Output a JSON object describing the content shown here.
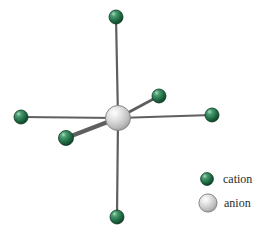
{
  "figure": {
    "title": "",
    "type": "octahedral-coordination-diagram",
    "background_color": "#ffffff"
  },
  "colors": {
    "cation_base": "#1f6b42",
    "cation_dark": "#0d3a22",
    "cation_highlight": "#8fd6ad",
    "anion_base": "#c9c9c9",
    "anion_dark": "#8a8a8a",
    "anion_highlight": "#ffffff",
    "bond": "#5f5f5f",
    "bond_outline": "#444444",
    "label_text": "#2b2b2b"
  },
  "center_ion": {
    "name": "anion",
    "cx": 118,
    "cy": 118,
    "r": 12.5
  },
  "ligands": [
    {
      "name": "cation-top",
      "cx": 116,
      "cy": 17,
      "r": 7.0,
      "bond_width": 2.2,
      "direction": "up"
    },
    {
      "name": "cation-bottom",
      "cx": 117,
      "cy": 217,
      "r": 7.0,
      "bond_width": 2.2,
      "direction": "down"
    },
    {
      "name": "cation-left",
      "cx": 21,
      "cy": 117,
      "r": 7.0,
      "bond_width": 2.2,
      "direction": "left"
    },
    {
      "name": "cation-right",
      "cx": 212,
      "cy": 115,
      "r": 7.0,
      "bond_width": 2.2,
      "direction": "right"
    },
    {
      "name": "cation-upper-right",
      "cx": 159,
      "cy": 96,
      "r": 7.0,
      "bond_width": 2.6,
      "direction": "back"
    },
    {
      "name": "cation-lower-left",
      "cx": 66,
      "cy": 138,
      "r": 7.5,
      "bond_width": 4.2,
      "direction": "front"
    }
  ],
  "legend": {
    "items": [
      {
        "key": "cation",
        "label": "cation",
        "swatch": "green-sphere",
        "r": 6.5
      },
      {
        "key": "anion",
        "label": "anion",
        "swatch": "gray-sphere",
        "r": 9.0
      }
    ]
  }
}
